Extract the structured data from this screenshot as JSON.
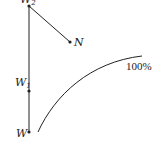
{
  "diagram": {
    "points": {
      "W2": {
        "label": "W",
        "subscript": "2",
        "x": 29,
        "y": 6
      },
      "N": {
        "label": "N",
        "x": 70,
        "y": 42
      },
      "W1": {
        "label": "W",
        "subscript": "1",
        "x": 29,
        "y": 91
      },
      "W": {
        "label": "W",
        "x": 29,
        "y": 132
      }
    },
    "segments": [
      {
        "from": "W2",
        "to": "W"
      },
      {
        "from": "W2",
        "to": "N"
      }
    ],
    "curve": {
      "label": "100%",
      "start": [
        38,
        132
      ],
      "end": [
        142,
        56
      ]
    },
    "colors": {
      "line": "#222222",
      "background": "#ffffff"
    }
  }
}
